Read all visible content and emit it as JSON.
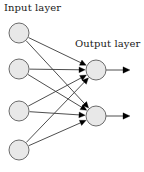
{
  "diagram": {
    "width": 144,
    "height": 172,
    "background": "#ffffff",
    "labels": {
      "input_layer": "Input layer",
      "output_layer": "Output layer"
    },
    "style": {
      "node_fill": "#e8e8e8",
      "node_stroke": "#6b6b6b",
      "node_stroke_width": 1,
      "node_radius": 10,
      "edge_color": "#3a3a3a",
      "edge_width": 0.9,
      "arrow_color": "#000000",
      "text_color": "#1a1a1a"
    },
    "input_nodes": [
      {
        "id": "i1",
        "label": "",
        "cx": 19,
        "cy": 33,
        "r": 10
      },
      {
        "id": "i2",
        "label": "",
        "cx": 19,
        "cy": 69,
        "r": 10
      },
      {
        "id": "i3",
        "label": "",
        "cx": 19,
        "cy": 111,
        "r": 10
      },
      {
        "id": "i4",
        "label": "",
        "cx": 19,
        "cy": 150,
        "r": 10
      }
    ],
    "output_nodes": [
      {
        "id": "o1",
        "label": "",
        "cx": 96,
        "cy": 70,
        "r": 10
      },
      {
        "id": "o2",
        "label": "",
        "cx": 96,
        "cy": 116,
        "r": 10
      }
    ],
    "edges": [
      {
        "from": "i1",
        "to": "o1",
        "arrow": true
      },
      {
        "from": "i1",
        "to": "o2",
        "arrow": true
      },
      {
        "from": "i2",
        "to": "o1",
        "arrow": true
      },
      {
        "from": "i2",
        "to": "o2",
        "arrow": true
      },
      {
        "from": "i3",
        "to": "o1",
        "arrow": true
      },
      {
        "from": "i3",
        "to": "o2",
        "arrow": true
      },
      {
        "from": "i4",
        "to": "o1",
        "arrow": true
      },
      {
        "from": "i4",
        "to": "o2",
        "arrow": true
      }
    ],
    "output_arrows": [
      {
        "from": "o1",
        "x1": 106,
        "y1": 70,
        "x2": 130,
        "y2": 70
      },
      {
        "from": "o2",
        "x1": 106,
        "y1": 116,
        "x2": 130,
        "y2": 116
      }
    ]
  }
}
